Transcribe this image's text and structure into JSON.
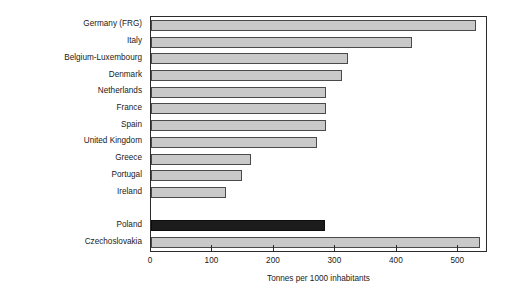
{
  "chart_data": {
    "type": "bar",
    "orientation": "horizontal",
    "title": "",
    "subtitle": "",
    "xlabel": "Tonnes per 1000 inhabitants",
    "ylabel": "",
    "xlim": [
      0,
      545
    ],
    "xticks": [
      0,
      100,
      200,
      300,
      400,
      500
    ],
    "xtick_labels": [
      "0",
      "100",
      "200",
      "300",
      "400",
      "500"
    ],
    "grid": false,
    "legend": null,
    "categories": [
      "Germany (FRG)",
      "Italy",
      "Belgium-Luxembourg",
      "Denmark",
      "Netherlands",
      "France",
      "Spain",
      "United Kingdom",
      "Greece",
      "Portugal",
      "Ireland",
      "",
      "Poland",
      "Czechoslovakia"
    ],
    "values": [
      528,
      425,
      320,
      310,
      285,
      285,
      285,
      270,
      162,
      148,
      122,
      null,
      283,
      535
    ],
    "bar_colors": [
      "#c9c9c9",
      "#c9c9c9",
      "#c9c9c9",
      "#c9c9c9",
      "#c9c9c9",
      "#c9c9c9",
      "#c9c9c9",
      "#c9c9c9",
      "#c9c9c9",
      "#c9c9c9",
      "#c9c9c9",
      null,
      "#1c1c1c",
      "#c9c9c9"
    ],
    "highlight_category": "Poland",
    "accent_color": "#1c1c1c",
    "bar_fill_color": "#c9c9c9",
    "bar_edge_color": "#4a4a4a",
    "frame_color": "#2b2b2b",
    "background_color": "#ffffff"
  }
}
